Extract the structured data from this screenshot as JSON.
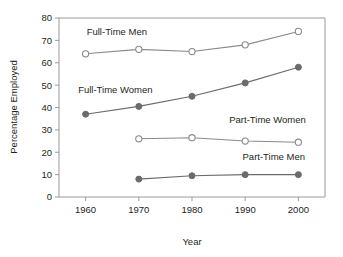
{
  "chart_data": {
    "type": "line",
    "title": "",
    "xlabel": "Year",
    "ylabel": "Percentage Employed",
    "x": [
      1960,
      1970,
      1980,
      1990,
      2000
    ],
    "categories": [
      "1960",
      "1970",
      "1980",
      "1990",
      "2000"
    ],
    "xlim": [
      1955,
      2005
    ],
    "ylim": [
      0,
      80
    ],
    "yticks": [
      0,
      10,
      20,
      30,
      40,
      50,
      60,
      70,
      80
    ],
    "ytick_labels": [
      "0",
      "10",
      "20",
      "30",
      "40",
      "50",
      "60",
      "70",
      "80"
    ],
    "xtick_labels": [
      "1960",
      "1970",
      "1980",
      "1990",
      "2000"
    ],
    "grid": false,
    "legend": "inline-labels",
    "series": [
      {
        "name": "Full-Time Men",
        "marker": "open-circle",
        "color": "#8a8a8a",
        "x": [
          1960,
          1970,
          1980,
          1990,
          2000
        ],
        "values": [
          64,
          66,
          65,
          68,
          74
        ]
      },
      {
        "name": "Full-Time Women",
        "marker": "filled-circle",
        "color": "#6b6b6b",
        "x": [
          1960,
          1970,
          1980,
          1990,
          2000
        ],
        "values": [
          37,
          40.5,
          45,
          51,
          58
        ]
      },
      {
        "name": "Part-Time Women",
        "marker": "open-circle",
        "color": "#8a8a8a",
        "x": [
          1970,
          1980,
          1990,
          2000
        ],
        "values": [
          26,
          26.5,
          25,
          24.5
        ]
      },
      {
        "name": "Part-Time Men",
        "marker": "filled-circle",
        "color": "#6b6b6b",
        "x": [
          1970,
          1980,
          1990,
          2000
        ],
        "values": [
          8,
          9.5,
          10,
          10
        ]
      }
    ],
    "annotations": [
      {
        "text": "Full-Time Men",
        "x": 1960.2,
        "y": 72.5,
        "anchor": "start"
      },
      {
        "text": "Full-Time Women",
        "x": 1958.6,
        "y": 46.5,
        "anchor": "start"
      },
      {
        "text": "Part-Time Women",
        "x": 1987.0,
        "y": 33.0,
        "anchor": "start"
      },
      {
        "text": "Part-Time Men",
        "x": 1989.5,
        "y": 16.5,
        "anchor": "start"
      }
    ],
    "colors": {
      "axis": "#9a9a9a",
      "text": "#231f20",
      "open_marker_stroke": "#8a8a8a",
      "open_marker_fill": "#ffffff",
      "filled_marker": "#6b6b6b",
      "background": "#ffffff"
    }
  }
}
